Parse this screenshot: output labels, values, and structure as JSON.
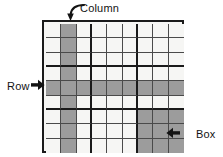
{
  "diagram": {
    "type": "sudoku-grid-annotated",
    "grid": {
      "rows": 9,
      "columns": 9,
      "box_rows": 3,
      "box_columns": 3,
      "cell_background": "#f6f6f4",
      "shaded_cell_color": "#9c9c9c",
      "outer_border_color": "#1a1a1a",
      "cell_border_color": "#4a4a4a",
      "highlighted_column_index": 2,
      "highlighted_row_index": 5,
      "highlighted_box_rows": [
        7,
        8,
        9
      ],
      "highlighted_box_columns": [
        7,
        8,
        9
      ]
    },
    "labels": {
      "column": "Column",
      "row": "Row",
      "box": "Box"
    },
    "icons": {
      "column_arrow": "curved-arrow-down-icon",
      "row_arrow": "arrow-right-icon",
      "box_arrow": "arrow-left-icon"
    }
  }
}
